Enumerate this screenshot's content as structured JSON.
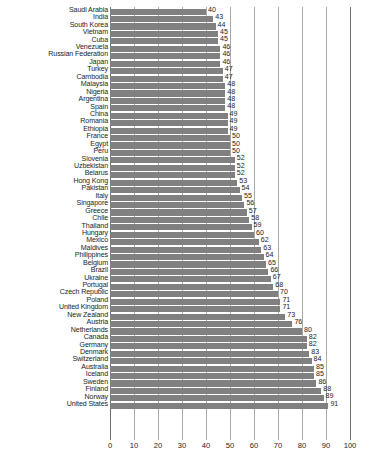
{
  "chart_data": {
    "type": "bar",
    "orientation": "horizontal",
    "title": "",
    "xlabel": "",
    "ylabel": "",
    "xlim": [
      0,
      100
    ],
    "xticks": [
      0,
      10,
      20,
      30,
      40,
      50,
      60,
      70,
      80,
      90,
      100
    ],
    "grid": true,
    "legend": null,
    "bar_color": "#808080",
    "categories": [
      "Saudi Arabia",
      "India",
      "South Korea",
      "Vietnam",
      "Cuba",
      "Venezuela",
      "Russian Federation",
      "Japan",
      "Turkey",
      "Cambodia",
      "Malaysia",
      "Nigeria",
      "Argentina",
      "Spain",
      "China",
      "Romania",
      "Ethiopia",
      "France",
      "Egypt",
      "Peru",
      "Slovenia",
      "Uzbekistan",
      "Belarus",
      "Hong Kong",
      "Pakistan",
      "Italy",
      "Singapore",
      "Greece",
      "Chile",
      "Thailand",
      "Hungary",
      "Mexico",
      "Maldives",
      "Philippines",
      "Belgium",
      "Brazil",
      "Ukraine",
      "Portugal",
      "Czech Republic",
      "Poland",
      "United Kingdom",
      "New Zealand",
      "Austria",
      "Netherlands",
      "Canada",
      "Germany",
      "Denmark",
      "Switzerland",
      "Australia",
      "Iceland",
      "Sweden",
      "Finland",
      "Norway",
      "United States"
    ],
    "values": [
      40,
      43,
      44,
      45,
      45,
      46,
      46,
      46,
      47,
      47,
      48,
      48,
      48,
      48,
      49,
      49,
      49,
      50,
      50,
      50,
      52,
      52,
      52,
      53,
      54,
      55,
      56,
      57,
      58,
      59,
      60,
      62,
      63,
      64,
      65,
      66,
      67,
      68,
      70,
      71,
      71,
      73,
      76,
      80,
      82,
      82,
      83,
      84,
      85,
      85,
      86,
      88,
      89,
      91
    ]
  },
  "caption": ""
}
